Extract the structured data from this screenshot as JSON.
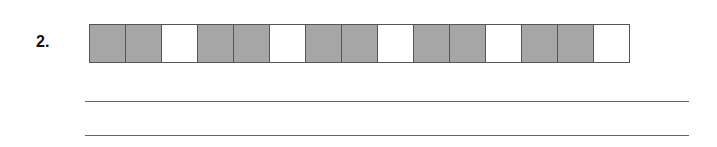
{
  "question": {
    "number": "2."
  },
  "strip": {
    "cells": [
      "shaded",
      "shaded",
      "blank",
      "shaded",
      "shaded",
      "blank",
      "shaded",
      "shaded",
      "blank",
      "shaded",
      "shaded",
      "blank",
      "shaded",
      "shaded",
      "blank"
    ],
    "shaded_color": "#a6a6a6",
    "blank_color": "#ffffff",
    "cell_count": 15,
    "shaded_count": 10
  },
  "answer_lines": [
    {
      "top": 101
    },
    {
      "top": 135
    }
  ]
}
